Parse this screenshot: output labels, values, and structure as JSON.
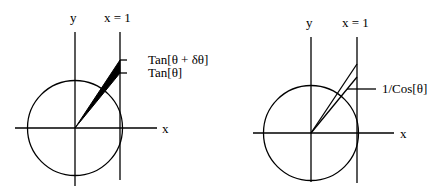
{
  "diagrams": [
    {
      "id": "left",
      "axis_labels": {
        "x": "x",
        "y": "y"
      },
      "line_label": "x = 1",
      "annotations": [
        "Tan[θ + δθ]",
        "Tan[θ]"
      ],
      "description": "Unit circle with filled wedge between angles θ and θ+δθ extended to the line x = 1"
    },
    {
      "id": "right",
      "axis_labels": {
        "x": "x",
        "y": "y"
      },
      "line_label": "x = 1",
      "annotations": [
        "1/Cos[θ]"
      ],
      "description": "Unit circle with two rays from origin to the line x = 1, segment labeled 1/Cos[θ]"
    }
  ],
  "colors": {
    "stroke": "#000000",
    "background": "#ffffff"
  }
}
